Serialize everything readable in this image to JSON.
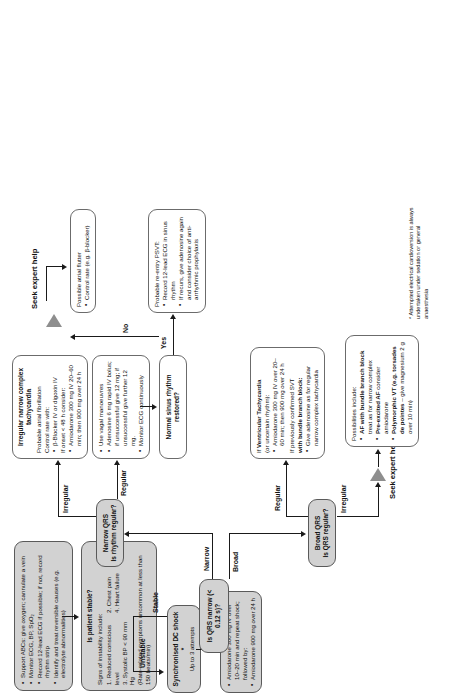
{
  "chart_type": "flowchart",
  "nodes": {
    "initial_assessment": {
      "bullets": [
        "Support ABCs: give oxygen; cannulate a vein",
        "Monitor ECG, BP, SpO₂",
        "Record 12-lead ECG if possible; if not, record rhythm strip",
        "Identify and treat reversible causes (e.g. electrolyte abnormalities)"
      ]
    },
    "is_patient_stable": {
      "title": "Is patient stable?",
      "sub_heading": "Signs of instability include:",
      "items": [
        "1. Reduced conscious level",
        "2. Chest pain",
        "3. Systolic BP < 90 mm Hg",
        "4. Heart failure"
      ],
      "footnote": "(Rate-related symptoms uncommon at less than 150 beats/min)"
    },
    "dc_shock": {
      "title": "Synchronised DC shock *",
      "sub": "Up to 3 attempts"
    },
    "amiodarone_unstable": {
      "bullets": [
        "Amiodarone 300 mg IV over 10–20 min and repeat shock; followed by:",
        "Amiodarone 900 mg over 24 h"
      ]
    },
    "is_qrs_narrow": {
      "title": "Is QRS narrow (< 0.12 s)?"
    },
    "narrow_qrs": {
      "title": "Narrow QRS",
      "sub": "Is rhythm regular?"
    },
    "broad_qrs": {
      "title": "Broad QRS",
      "sub": "Is QRS regular?"
    },
    "vagal": {
      "bullets": [
        "Use vagal manoeuvres",
        "Adenosine 6 mg rapid IV bolus; if unsuccessful give 12 mg; if unsuccessful give further 12 mg.",
        "Monitor ECG continuously"
      ]
    },
    "sinus_restored": {
      "title": "Normal sinus rhythm restored?"
    },
    "psvt": {
      "title": "Probable re-entry PSVT:",
      "bullets": [
        "Record 12-lead ECG in sinus rhythm",
        "If recurs, give adenosine again and consider choice of anti-arrhythmic prophylaxis"
      ]
    },
    "atrial_flutter": {
      "title": "Possible atrial flutter",
      "bullets": [
        "Control rate (e.g. β-blocker)"
      ]
    },
    "irregular_narrow": {
      "title_line1": "Irregular narrow complex",
      "title_line2": "tachycardia",
      "sub": "Probable atrial fibrillation",
      "control": "Control rate with:",
      "bullets_1": [
        "β-Blocker IV or digoxin IV"
      ],
      "onset": "If onset < 48 h consider:",
      "bullets_2": [
        "Amiodarone 300 mg IV 20–60 min; then 900 mg over 24 h"
      ]
    },
    "vt_box": {
      "line1_lead": "If ",
      "line1_bold": "Ventricular Tachycardia",
      "line2": "(or uncertain rhythm):",
      "bullets": [
        "Amiodarone 300 mg IV over 20–60 min; then 900 mg over 24 h"
      ],
      "line3": "If previously confirmed SVT",
      "line3_bold": "with bundle branch block:",
      "bullets_2": [
        "Give adenosine as for regular narrow complex tachycardia"
      ]
    },
    "possibilities": {
      "heading": "Possibilities include:",
      "items": [
        {
          "bold": "AF with bundle branch block",
          "rest": " treat as for narrow complex"
        },
        {
          "bold": "Pre-excited AF",
          "rest": " consider amiodarone"
        },
        {
          "bold": "Polymorphic VT (e.g. torsades de pointes",
          "rest": " – give magnesium 2 g over 10 min)"
        }
      ]
    }
  },
  "edge_labels": {
    "unstable": "Unstable",
    "stable": "Stable",
    "narrow": "Narrow",
    "broad": "Broad",
    "regular_narrow": "Regular",
    "irregular_narrow": "Irregular",
    "regular_broad": "Regular",
    "irregular_broad": "Irregular",
    "yes": "Yes",
    "no": "No"
  },
  "seek_help": {
    "narrow_path": "Seek expert help",
    "broad_path": "Seek expert help"
  },
  "footnote": {
    "text": "* Attempted electrical cardioversion is always undertaken under sedation or general anaesthesia"
  },
  "colors": {
    "shaded_fill": "#d2d2d2",
    "border": "#6b6b6b",
    "line": "#1a1a1a",
    "triangle": "#8e8e8e"
  }
}
